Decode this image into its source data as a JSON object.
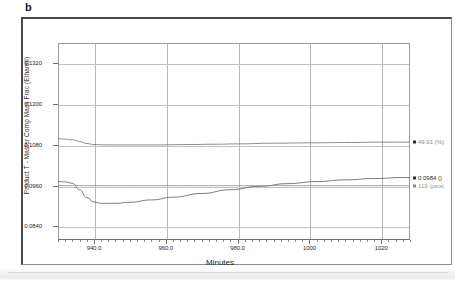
{
  "panel": {
    "letter": "b"
  },
  "chart_data": {
    "type": "line",
    "title": "",
    "xlabel": "Minutes",
    "ylabel": "Product T - Master Comp Mass Frac (Ethanol)",
    "xlim": [
      930.0,
      1028.0
    ],
    "ylim": [
      0.08,
      0.138
    ],
    "grid": true,
    "legend": "right-annotations",
    "x_ticks": [
      "940.0",
      "960.0",
      "980.0",
      "1000",
      "1020"
    ],
    "x_tick_values": [
      940.0,
      960.0,
      980.0,
      1000.0,
      1020.0
    ],
    "y_ticks": [
      "0.1320",
      "0.1200",
      "0.1080",
      "0.0960",
      "0.0840"
    ],
    "y_tick_values": [
      0.132,
      0.12,
      0.108,
      0.096,
      0.084
    ],
    "series": [
      {
        "name": "49.91 (%)",
        "color": "#6e6e6e",
        "end_label": "49.91 (%)",
        "end_label_color": "#8a8a8a",
        "x": [
          930,
          932,
          934,
          936,
          938,
          940,
          944,
          950,
          958,
          966,
          974,
          980,
          990,
          1000,
          1010,
          1020,
          1028
        ],
        "y": [
          0.1098,
          0.1097,
          0.1095,
          0.109,
          0.1084,
          0.1081,
          0.108,
          0.108,
          0.108,
          0.1081,
          0.1082,
          0.1083,
          0.1085,
          0.1086,
          0.1087,
          0.1088,
          0.1088
        ]
      },
      {
        "name": "0.0984 ()",
        "color": "#5a5a5a",
        "end_label": "0.0984 ()",
        "end_label_color": "#2a2a2a",
        "x": [
          930,
          932,
          934,
          936,
          938,
          940,
          942,
          946,
          950,
          956,
          962,
          970,
          978,
          986,
          994,
          1002,
          1010,
          1018,
          1026,
          1028
        ],
        "y": [
          0.0972,
          0.0971,
          0.0967,
          0.0948,
          0.0925,
          0.0912,
          0.0908,
          0.0908,
          0.0911,
          0.0918,
          0.0926,
          0.0937,
          0.0948,
          0.0958,
          0.0966,
          0.0972,
          0.0977,
          0.0981,
          0.0984,
          0.0984
        ]
      },
      {
        "name": "119 (psia)",
        "color": "#8a8a8a",
        "end_label": "119 (psia)",
        "end_label_color": "#9a9a9a",
        "x": [
          930,
          940,
          960,
          980,
          1000,
          1020,
          1028
        ],
        "y": [
          0.096,
          0.096,
          0.096,
          0.096,
          0.096,
          0.096,
          0.096
        ]
      }
    ],
    "annotations": [
      {
        "text": "49.91 (%)",
        "value": 0.1088,
        "color": "#8a8a8a"
      },
      {
        "text": "0.0984 ()",
        "value": 0.0984,
        "color": "#2a2a2a"
      },
      {
        "text": "119 (psia)",
        "value": 0.096,
        "color": "#9a9a9a"
      }
    ]
  }
}
